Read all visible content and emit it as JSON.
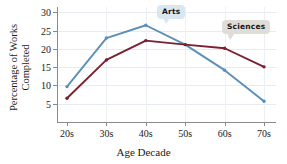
{
  "chart_data": {
    "type": "line",
    "title": "",
    "xlabel": "Age Decade",
    "ylabel_line1": "Percentage of Works",
    "ylabel_line2": "Completed",
    "categories": [
      "20s",
      "30s",
      "40s",
      "50s",
      "60s",
      "70s"
    ],
    "yticks": [
      5,
      10,
      15,
      20,
      25,
      30
    ],
    "ytick_labels": [
      "5",
      "10",
      "15",
      "20",
      "25",
      "30"
    ],
    "ylim": [
      0,
      31.5
    ],
    "grid": true,
    "legend_position": "inline-callouts",
    "series": [
      {
        "name": "Arts",
        "color": "#5b8fb9",
        "marker": "circle",
        "values": [
          9.7,
          23.0,
          26.5,
          21.2,
          14.2,
          5.7
        ]
      },
      {
        "name": "Sciences",
        "color": "#7a2030",
        "marker": "circle",
        "values": [
          6.5,
          17.0,
          22.3,
          21.2,
          20.2,
          15.1
        ]
      }
    ],
    "annotations": [
      {
        "label": "Arts",
        "box_color": "#d9e7f2",
        "points_to": "arts-series"
      },
      {
        "label": "Sciences",
        "box_color": "#e0ddd7",
        "points_to": "sciences-series"
      }
    ]
  }
}
